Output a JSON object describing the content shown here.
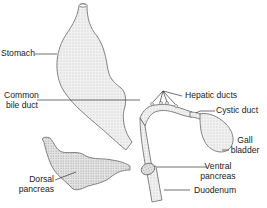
{
  "diagram": {
    "title": "",
    "structures": [
      {
        "id": "stomach",
        "label": "Stomach"
      },
      {
        "id": "hepatic-ducts",
        "label": "Hepatic ducts"
      },
      {
        "id": "cystic-duct",
        "label": "Cystic duct"
      },
      {
        "id": "common-bile-duct",
        "label_line1": "Common",
        "label_line2": "bile duct"
      },
      {
        "id": "gall-bladder",
        "label_line1": "Gall",
        "label_line2": "bladder"
      },
      {
        "id": "dorsal-pancreas",
        "label_line1": "Dorsal",
        "label_line2": "pancreas"
      },
      {
        "id": "ventral-pancreas",
        "label_line1": "Ventral",
        "label_line2": "pancreas"
      },
      {
        "id": "duodenum",
        "label": "Duodenum"
      }
    ],
    "colors": {
      "outline": "#555555",
      "fill": "#ececec",
      "leader": "#333333",
      "text": "#222222"
    }
  }
}
